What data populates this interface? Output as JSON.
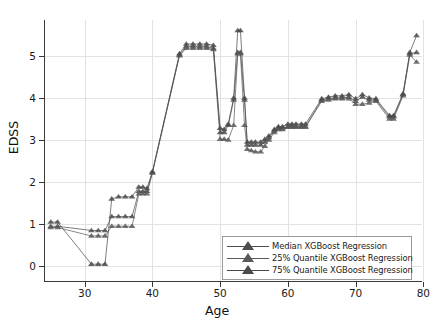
{
  "chart_data": {
    "type": "line",
    "title": "",
    "xlabel": "Age",
    "ylabel": "EDSS",
    "xlim": [
      24.0,
      79.8
    ],
    "ylim": [
      -0.35,
      5.85
    ],
    "xticks": [
      30,
      40,
      50,
      60,
      70,
      80
    ],
    "yticks": [
      0,
      1,
      2,
      3,
      4,
      5
    ],
    "grid": true,
    "legend_position": "lower right",
    "marker": "triangle-up",
    "series": [
      {
        "name": "Median XGBoost Regression",
        "color": "#4d4d4d",
        "x": [
          25.0,
          26.0,
          31.0,
          32.0,
          33.0,
          34.0,
          35.0,
          36.0,
          37.0,
          38.0,
          38.6,
          39.2,
          40.0,
          44.0,
          45.0,
          46.0,
          47.0,
          48.0,
          49.0,
          50.0,
          50.6,
          51.2,
          52.0,
          52.6,
          53.0,
          53.6,
          54.0,
          54.6,
          55.2,
          56.0,
          56.6,
          57.2,
          58.0,
          58.6,
          59.2,
          60.0,
          60.6,
          61.2,
          62.0,
          62.6,
          65.0,
          66.0,
          67.0,
          68.0,
          69.0,
          70.0,
          71.0,
          72.0,
          73.0,
          75.0,
          75.6,
          77.0,
          78.0,
          79.0
        ],
        "y": [
          0.95,
          0.95,
          0.85,
          0.85,
          0.85,
          1.18,
          1.18,
          1.18,
          1.18,
          1.78,
          1.78,
          1.78,
          2.22,
          5.02,
          5.22,
          5.22,
          5.22,
          5.22,
          5.18,
          3.18,
          3.18,
          3.35,
          3.95,
          5.08,
          5.08,
          3.95,
          2.88,
          2.88,
          2.88,
          2.88,
          2.95,
          3.05,
          3.22,
          3.28,
          3.28,
          3.32,
          3.32,
          3.32,
          3.32,
          3.32,
          3.95,
          3.98,
          4.0,
          4.0,
          4.02,
          3.92,
          4.02,
          3.95,
          3.95,
          3.55,
          3.55,
          4.08,
          5.05,
          5.08
        ]
      },
      {
        "name": "25% Quantile XGBoost Regression",
        "color": "#5a5a5a",
        "x": [
          25.0,
          26.0,
          31.0,
          32.0,
          33.0,
          34.0,
          35.0,
          36.0,
          37.0,
          38.0,
          38.6,
          39.2,
          40.0,
          44.0,
          45.0,
          46.0,
          47.0,
          48.0,
          49.0,
          50.0,
          50.6,
          51.2,
          52.0,
          52.6,
          53.0,
          53.6,
          54.0,
          54.6,
          55.2,
          56.0,
          56.6,
          57.2,
          58.0,
          58.6,
          59.2,
          60.0,
          60.6,
          61.2,
          62.0,
          62.6,
          65.0,
          66.0,
          67.0,
          68.0,
          69.0,
          70.0,
          71.0,
          72.0,
          73.0,
          75.0,
          75.6,
          77.0,
          78.0,
          79.0
        ],
        "y": [
          0.92,
          0.92,
          0.72,
          0.72,
          0.72,
          0.95,
          0.95,
          0.95,
          0.95,
          1.72,
          1.72,
          1.72,
          2.22,
          5.0,
          5.18,
          5.18,
          5.18,
          5.18,
          5.15,
          3.02,
          3.02,
          3.0,
          3.35,
          5.05,
          5.05,
          3.35,
          2.78,
          2.75,
          2.72,
          2.72,
          2.85,
          3.0,
          3.18,
          3.25,
          3.25,
          3.3,
          3.3,
          3.3,
          3.3,
          3.3,
          3.92,
          3.95,
          3.98,
          3.98,
          3.98,
          3.85,
          3.85,
          3.88,
          3.92,
          3.5,
          3.5,
          4.05,
          5.02,
          4.85
        ]
      },
      {
        "name": "75% Quantile XGBoost Regression",
        "color": "#4a4a4a",
        "x": [
          25.0,
          26.0,
          31.0,
          32.0,
          33.0,
          34.0,
          35.0,
          36.0,
          37.0,
          38.0,
          38.6,
          39.2,
          40.0,
          44.0,
          45.0,
          46.0,
          47.0,
          48.0,
          49.0,
          50.0,
          50.6,
          51.2,
          52.0,
          52.6,
          53.0,
          53.6,
          54.0,
          54.6,
          55.2,
          56.0,
          56.6,
          57.2,
          58.0,
          58.6,
          59.2,
          60.0,
          60.6,
          61.2,
          62.0,
          62.6,
          65.0,
          66.0,
          67.0,
          68.0,
          69.0,
          70.0,
          71.0,
          72.0,
          73.0,
          75.0,
          75.6,
          77.0,
          78.0,
          79.0
        ],
        "y": [
          1.05,
          1.05,
          0.05,
          0.05,
          0.05,
          1.6,
          1.65,
          1.65,
          1.65,
          1.88,
          1.88,
          1.85,
          2.25,
          5.05,
          5.28,
          5.28,
          5.28,
          5.28,
          5.25,
          3.28,
          3.25,
          3.38,
          4.0,
          5.6,
          5.6,
          4.0,
          2.95,
          2.95,
          2.95,
          2.95,
          3.02,
          3.1,
          3.25,
          3.32,
          3.32,
          3.38,
          3.38,
          3.38,
          3.38,
          3.38,
          3.98,
          4.02,
          4.05,
          4.05,
          4.08,
          3.98,
          4.08,
          4.0,
          3.98,
          3.58,
          3.58,
          4.1,
          5.08,
          5.48
        ]
      }
    ]
  },
  "axes": {
    "ylabel_text": "EDSS",
    "xlabel_text": "Age",
    "xtick_labels": [
      "30",
      "40",
      "50",
      "60",
      "70",
      "80"
    ],
    "ytick_labels": [
      "0",
      "1",
      "2",
      "3",
      "4",
      "5"
    ]
  },
  "legend": {
    "entries": [
      {
        "label": "Median XGBoost Regression",
        "color": "#4d4d4d"
      },
      {
        "label": "25% Quantile XGBoost Regression",
        "color": "#5a5a5a"
      },
      {
        "label": "75% Quantile XGBoost Regression",
        "color": "#4a4a4a"
      }
    ]
  },
  "style": {
    "background": "#ffffff",
    "grid_color": "#e2e2e2",
    "axis_color": "#3a3a3a",
    "text_color": "#1a1a1a"
  }
}
